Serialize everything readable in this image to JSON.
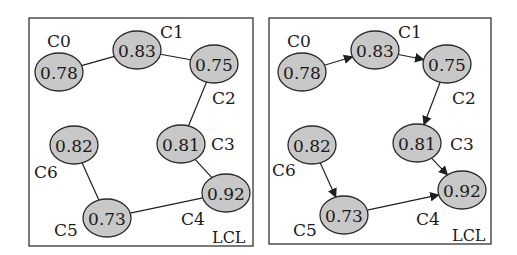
{
  "figure": {
    "panels": [
      {
        "id": "undirected",
        "frame": {
          "x": 29,
          "y": 18,
          "w": 224,
          "h": 228
        },
        "tag": "LCL",
        "tag_pos": {
          "x": 212,
          "y": 243
        },
        "directed": false,
        "nodes": [
          {
            "id": "C0",
            "label": "C0",
            "value": "0.78",
            "cx": 59,
            "cy": 72,
            "rx": 24,
            "ry": 19,
            "label_x": 47,
            "label_y": 47
          },
          {
            "id": "C1",
            "label": "C1",
            "value": "0.83",
            "cx": 137,
            "cy": 50,
            "rx": 24,
            "ry": 19,
            "label_x": 160,
            "label_y": 38
          },
          {
            "id": "C2",
            "label": "C2",
            "value": "0.75",
            "cx": 214,
            "cy": 64,
            "rx": 24,
            "ry": 19,
            "label_x": 212,
            "label_y": 104
          },
          {
            "id": "C3",
            "label": "C3",
            "value": "0.81",
            "cx": 181,
            "cy": 144,
            "rx": 24,
            "ry": 19,
            "label_x": 211,
            "label_y": 150
          },
          {
            "id": "C4",
            "label": "C4",
            "value": "0.92",
            "cx": 226,
            "cy": 193,
            "rx": 24,
            "ry": 19,
            "label_x": 181,
            "label_y": 225
          },
          {
            "id": "C5",
            "label": "C5",
            "value": "0.73",
            "cx": 107,
            "cy": 218,
            "rx": 24,
            "ry": 19,
            "label_x": 54,
            "label_y": 236
          },
          {
            "id": "C6",
            "label": "C6",
            "value": "0.82",
            "cx": 74,
            "cy": 145,
            "rx": 24,
            "ry": 19,
            "label_x": 34,
            "label_y": 178
          }
        ],
        "edges": [
          {
            "from": "C0",
            "to": "C1"
          },
          {
            "from": "C1",
            "to": "C2"
          },
          {
            "from": "C2",
            "to": "C3"
          },
          {
            "from": "C3",
            "to": "C4"
          },
          {
            "from": "C4",
            "to": "C5"
          },
          {
            "from": "C5",
            "to": "C6"
          }
        ]
      },
      {
        "id": "directed",
        "frame": {
          "x": 269,
          "y": 18,
          "w": 222,
          "h": 226
        },
        "tag": "LCL",
        "tag_pos": {
          "x": 452,
          "y": 241
        },
        "directed": true,
        "nodes": [
          {
            "id": "C0",
            "label": "C0",
            "value": "0.78",
            "cx": 302,
            "cy": 72,
            "rx": 24,
            "ry": 19,
            "label_x": 287,
            "label_y": 47
          },
          {
            "id": "C1",
            "label": "C1",
            "value": "0.83",
            "cx": 375,
            "cy": 50,
            "rx": 24,
            "ry": 19,
            "label_x": 398,
            "label_y": 38
          },
          {
            "id": "C2",
            "label": "C2",
            "value": "0.75",
            "cx": 447,
            "cy": 64,
            "rx": 24,
            "ry": 19,
            "label_x": 452,
            "label_y": 104
          },
          {
            "id": "C3",
            "label": "C3",
            "value": "0.81",
            "cx": 417,
            "cy": 143,
            "rx": 24,
            "ry": 19,
            "label_x": 450,
            "label_y": 150
          },
          {
            "id": "C4",
            "label": "C4",
            "value": "0.92",
            "cx": 462,
            "cy": 190,
            "rx": 24,
            "ry": 19,
            "label_x": 416,
            "label_y": 225
          },
          {
            "id": "C5",
            "label": "C5",
            "value": "0.73",
            "cx": 344,
            "cy": 215,
            "rx": 24,
            "ry": 19,
            "label_x": 293,
            "label_y": 236
          },
          {
            "id": "C6",
            "label": "C6",
            "value": "0.82",
            "cx": 312,
            "cy": 145,
            "rx": 24,
            "ry": 19,
            "label_x": 272,
            "label_y": 176
          }
        ],
        "edges": [
          {
            "from": "C0",
            "to": "C1"
          },
          {
            "from": "C1",
            "to": "C2"
          },
          {
            "from": "C2",
            "to": "C3"
          },
          {
            "from": "C3",
            "to": "C4"
          },
          {
            "from": "C6",
            "to": "C5"
          },
          {
            "from": "C5",
            "to": "C4"
          }
        ]
      }
    ],
    "colors": {
      "node_fill": "#c8c8c8",
      "node_stroke": "#2a2a2a",
      "edge": "#1f1f1f",
      "frame": "#333333",
      "text": "#1a1a1a"
    }
  }
}
